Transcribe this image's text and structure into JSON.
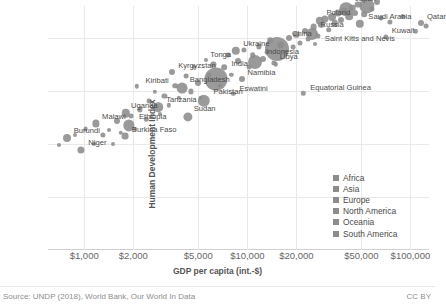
{
  "chart_data": {
    "type": "scatter",
    "title": "",
    "xlabel": "GDP per capita (int.-$)",
    "ylabel": "Human Development Index",
    "xscale": "log",
    "xlim": [
      600,
      130000
    ],
    "ylim": [
      0,
      0.92
    ],
    "grid": true,
    "legend_position": "right-inner",
    "xticks": [
      {
        "value": 1000,
        "label": "$1,000"
      },
      {
        "value": 2000,
        "label": "$2,000"
      },
      {
        "value": 5000,
        "label": "$5,000"
      },
      {
        "value": 10000,
        "label": "$10,000"
      },
      {
        "value": 20000,
        "label": "$20,000"
      },
      {
        "value": 50000,
        "label": "$50,000"
      },
      {
        "value": 100000,
        "label": "$100,000"
      }
    ],
    "yticks": [
      {
        "value": 0,
        "label": "0"
      },
      {
        "value": 0.2,
        "label": "0.2"
      },
      {
        "value": 0.4,
        "label": "0.4"
      },
      {
        "value": 0.6,
        "label": "0.6"
      },
      {
        "value": 0.8,
        "label": "0.8"
      }
    ],
    "legend": [
      {
        "name": "Africa",
        "color": "#8c8c8c"
      },
      {
        "name": "Asia",
        "color": "#8c8c8c"
      },
      {
        "name": "Europe",
        "color": "#8c8c8c"
      },
      {
        "name": "North America",
        "color": "#8c8c8c"
      },
      {
        "name": "Oceania",
        "color": "#8c8c8c"
      },
      {
        "name": "South America",
        "color": "#8c8c8c"
      }
    ],
    "points": [
      {
        "label": "Burundi",
        "x": 780,
        "y": 0.423,
        "r": 4.0
      },
      {
        "label": "Niger",
        "x": 960,
        "y": 0.377,
        "r": 3.6
      },
      {
        "label": "Malawi",
        "x": 1180,
        "y": 0.477,
        "r": 3.6
      },
      {
        "label": "Uganda",
        "x": 1800,
        "y": 0.516,
        "r": 4.2
      },
      {
        "label": "Ethiopia",
        "x": 1880,
        "y": 0.47,
        "r": 5.6
      },
      {
        "label": "Burkina Faso",
        "x": 1780,
        "y": 0.43,
        "r": 3.4
      },
      {
        "label": "Tanzania",
        "x": 2850,
        "y": 0.538,
        "r": 4.8
      },
      {
        "label": "Kiribati",
        "x": 2100,
        "y": 0.617,
        "r": 2.2
      },
      {
        "label": "Kyrgyzstan",
        "x": 3450,
        "y": 0.672,
        "r": 3.0
      },
      {
        "label": "Bangladesh",
        "x": 4000,
        "y": 0.611,
        "r": 5.4
      },
      {
        "label": "Pakistan",
        "x": 5400,
        "y": 0.562,
        "r": 6.2
      },
      {
        "label": "Sudan",
        "x": 4300,
        "y": 0.502,
        "r": 4.6
      },
      {
        "label": "India",
        "x": 6400,
        "y": 0.645,
        "r": 11.5
      },
      {
        "label": "Tonga",
        "x": 5600,
        "y": 0.717,
        "r": 2.0
      },
      {
        "label": "Eswatini",
        "x": 8200,
        "y": 0.588,
        "r": 2.2
      },
      {
        "label": "Namibia",
        "x": 9300,
        "y": 0.645,
        "r": 3.0
      },
      {
        "label": "Ukraine",
        "x": 8500,
        "y": 0.751,
        "r": 4.2
      },
      {
        "label": "Indonesia",
        "x": 11200,
        "y": 0.707,
        "r": 7.0
      },
      {
        "label": "Libya",
        "x": 14500,
        "y": 0.706,
        "r": 2.6
      },
      {
        "label": "China",
        "x": 15300,
        "y": 0.758,
        "r": 12.0
      },
      {
        "label": "Russia",
        "x": 24800,
        "y": 0.816,
        "r": 6.0
      },
      {
        "label": "Poland",
        "x": 27800,
        "y": 0.865,
        "r": 4.2
      },
      {
        "label": "Saint Kitts and Nevis",
        "x": 26000,
        "y": 0.778,
        "r": 2.0
      },
      {
        "label": "Equatorial Guinea",
        "x": 22000,
        "y": 0.591,
        "r": 2.2
      },
      {
        "label": "Japan",
        "x": 40500,
        "y": 0.909,
        "r": 6.8
      },
      {
        "label": "United States",
        "x": 54000,
        "y": 0.92,
        "r": 7.6
      },
      {
        "label": "Saudi Arabia",
        "x": 49000,
        "y": 0.853,
        "r": 4.2
      },
      {
        "label": "Kuwait",
        "x": 71000,
        "y": 0.803,
        "r": 2.6
      },
      {
        "label": "Qatar",
        "x": 116000,
        "y": 0.856,
        "r": 3.0
      }
    ],
    "unlabeled_points": [
      {
        "x": 700,
        "y": 0.396,
        "r": 2.0
      },
      {
        "x": 880,
        "y": 0.435,
        "r": 2.0
      },
      {
        "x": 1020,
        "y": 0.455,
        "r": 2.4
      },
      {
        "x": 1150,
        "y": 0.4,
        "r": 2.0
      },
      {
        "x": 1300,
        "y": 0.434,
        "r": 2.6
      },
      {
        "x": 1420,
        "y": 0.452,
        "r": 2.0
      },
      {
        "x": 1500,
        "y": 0.398,
        "r": 2.0
      },
      {
        "x": 1600,
        "y": 0.487,
        "r": 3.0
      },
      {
        "x": 1680,
        "y": 0.441,
        "r": 2.2
      },
      {
        "x": 1950,
        "y": 0.505,
        "r": 2.4
      },
      {
        "x": 2050,
        "y": 0.455,
        "r": 2.0
      },
      {
        "x": 2200,
        "y": 0.53,
        "r": 2.6
      },
      {
        "x": 2400,
        "y": 0.493,
        "r": 2.2
      },
      {
        "x": 2500,
        "y": 0.56,
        "r": 2.4
      },
      {
        "x": 2700,
        "y": 0.596,
        "r": 2.2
      },
      {
        "x": 2900,
        "y": 0.512,
        "r": 2.0
      },
      {
        "x": 3100,
        "y": 0.58,
        "r": 2.6
      },
      {
        "x": 3300,
        "y": 0.545,
        "r": 2.2
      },
      {
        "x": 3600,
        "y": 0.62,
        "r": 2.8
      },
      {
        "x": 3800,
        "y": 0.575,
        "r": 2.2
      },
      {
        "x": 4200,
        "y": 0.655,
        "r": 2.4
      },
      {
        "x": 4500,
        "y": 0.598,
        "r": 2.6
      },
      {
        "x": 4700,
        "y": 0.69,
        "r": 2.2
      },
      {
        "x": 5000,
        "y": 0.628,
        "r": 3.0
      },
      {
        "x": 5200,
        "y": 0.573,
        "r": 2.2
      },
      {
        "x": 5800,
        "y": 0.66,
        "r": 2.4
      },
      {
        "x": 6200,
        "y": 0.7,
        "r": 2.6
      },
      {
        "x": 6800,
        "y": 0.618,
        "r": 2.2
      },
      {
        "x": 7200,
        "y": 0.69,
        "r": 2.8
      },
      {
        "x": 7600,
        "y": 0.735,
        "r": 2.4
      },
      {
        "x": 8000,
        "y": 0.66,
        "r": 2.2
      },
      {
        "x": 8800,
        "y": 0.712,
        "r": 3.0
      },
      {
        "x": 9500,
        "y": 0.755,
        "r": 2.6
      },
      {
        "x": 10200,
        "y": 0.69,
        "r": 2.4
      },
      {
        "x": 10800,
        "y": 0.735,
        "r": 2.8
      },
      {
        "x": 11800,
        "y": 0.768,
        "r": 2.6
      },
      {
        "x": 12500,
        "y": 0.72,
        "r": 3.0
      },
      {
        "x": 13200,
        "y": 0.745,
        "r": 2.4
      },
      {
        "x": 13800,
        "y": 0.79,
        "r": 2.8
      },
      {
        "x": 15000,
        "y": 0.7,
        "r": 2.2
      },
      {
        "x": 16000,
        "y": 0.772,
        "r": 3.4
      },
      {
        "x": 17000,
        "y": 0.745,
        "r": 2.6
      },
      {
        "x": 18000,
        "y": 0.8,
        "r": 3.0
      },
      {
        "x": 19000,
        "y": 0.765,
        "r": 2.4
      },
      {
        "x": 20000,
        "y": 0.812,
        "r": 3.2
      },
      {
        "x": 21000,
        "y": 0.78,
        "r": 2.6
      },
      {
        "x": 22500,
        "y": 0.826,
        "r": 3.0
      },
      {
        "x": 23500,
        "y": 0.795,
        "r": 2.4
      },
      {
        "x": 25500,
        "y": 0.84,
        "r": 3.4
      },
      {
        "x": 27000,
        "y": 0.806,
        "r": 2.6
      },
      {
        "x": 28500,
        "y": 0.848,
        "r": 3.2
      },
      {
        "x": 30000,
        "y": 0.872,
        "r": 3.6
      },
      {
        "x": 31500,
        "y": 0.83,
        "r": 2.8
      },
      {
        "x": 33000,
        "y": 0.88,
        "r": 4.0
      },
      {
        "x": 34500,
        "y": 0.855,
        "r": 3.2
      },
      {
        "x": 36000,
        "y": 0.893,
        "r": 3.6
      },
      {
        "x": 37500,
        "y": 0.868,
        "r": 3.0
      },
      {
        "x": 39000,
        "y": 0.9,
        "r": 3.4
      },
      {
        "x": 42000,
        "y": 0.882,
        "r": 3.8
      },
      {
        "x": 44000,
        "y": 0.913,
        "r": 3.2
      },
      {
        "x": 46000,
        "y": 0.895,
        "r": 3.0
      },
      {
        "x": 48000,
        "y": 0.925,
        "r": 3.4
      },
      {
        "x": 52000,
        "y": 0.89,
        "r": 2.8
      },
      {
        "x": 58000,
        "y": 0.908,
        "r": 2.6
      },
      {
        "x": 62000,
        "y": 0.935,
        "r": 3.0
      },
      {
        "x": 66000,
        "y": 0.873,
        "r": 2.4
      },
      {
        "x": 75000,
        "y": 0.86,
        "r": 2.6
      },
      {
        "x": 90000,
        "y": 0.88,
        "r": 2.4
      },
      {
        "x": 108000,
        "y": 0.825,
        "r": 2.2
      },
      {
        "x": 125000,
        "y": 0.845,
        "r": 2.4
      }
    ]
  },
  "footer": {
    "source": "Source: UNDP (2018), World Bank, Our World In Data",
    "license": "CC BY"
  }
}
